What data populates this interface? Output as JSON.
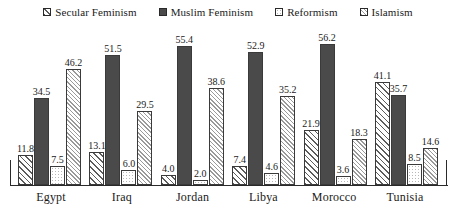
{
  "chart_data": {
    "type": "bar",
    "title": "",
    "subtitle": "",
    "xlabel": "",
    "ylabel": "",
    "ylim": [
      0,
      60
    ],
    "grid": false,
    "legend_position": "top-center",
    "categories": [
      "Egypt",
      "Iraq",
      "Jordan",
      "Libya",
      "Morocco",
      "Tunisia"
    ],
    "series": [
      {
        "name": "Secular Feminism",
        "swatch": "diagonal-hatch-dark",
        "color": "#5c5c5c",
        "values": [
          11.8,
          13.1,
          4.0,
          7.4,
          21.9,
          41.1
        ]
      },
      {
        "name": "Muslim Feminism",
        "swatch": "solid-dark",
        "color": "#4a4a4a",
        "values": [
          34.5,
          51.5,
          55.4,
          52.9,
          56.2,
          35.7
        ]
      },
      {
        "name": "Reformism",
        "swatch": "white-dotted",
        "color": "#ffffff",
        "values": [
          7.5,
          6.0,
          2.0,
          4.6,
          3.6,
          8.5
        ]
      },
      {
        "name": "Islamism",
        "swatch": "diagonal-hatch-light",
        "color": "#9a9a9a",
        "values": [
          46.2,
          29.5,
          38.6,
          35.2,
          18.3,
          14.6
        ]
      }
    ],
    "data_labels": [
      [
        "11.8",
        "34.5",
        "7.5",
        "46.2"
      ],
      [
        "13.1",
        "51.5",
        "6.0",
        "29.5"
      ],
      [
        "4.0",
        "55.4",
        "2.0",
        "38.6"
      ],
      [
        "7.4",
        "52.9",
        "4.6",
        "35.2"
      ],
      [
        "21.9",
        "56.2",
        "3.6",
        "18.3"
      ],
      [
        "41.1",
        "35.7",
        "8.5",
        "14.6"
      ]
    ]
  },
  "legend": {
    "items": [
      {
        "label": "Secular Feminism"
      },
      {
        "label": "Muslim Feminism"
      },
      {
        "label": "Reformism"
      },
      {
        "label": "Islamism"
      }
    ]
  },
  "axis": {
    "baseline_color": "#2a2a2a"
  }
}
